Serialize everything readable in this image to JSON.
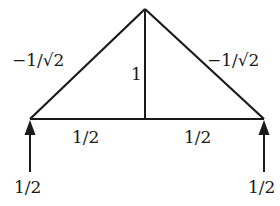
{
  "diagram": {
    "type": "truss-force-diagram",
    "colors": {
      "line": "#1a1a1a",
      "background": "#ffffff"
    },
    "members": {
      "left_diagonal": {
        "label": "−1/√2"
      },
      "right_diagonal": {
        "label": "−1/√2"
      },
      "vertical": {
        "label": "1"
      },
      "bottom_left": {
        "label": "1/2"
      },
      "bottom_right": {
        "label": "1/2"
      }
    },
    "reactions": {
      "left": {
        "label": "1/2",
        "direction": "up"
      },
      "right": {
        "label": "1/2",
        "direction": "up"
      }
    }
  }
}
